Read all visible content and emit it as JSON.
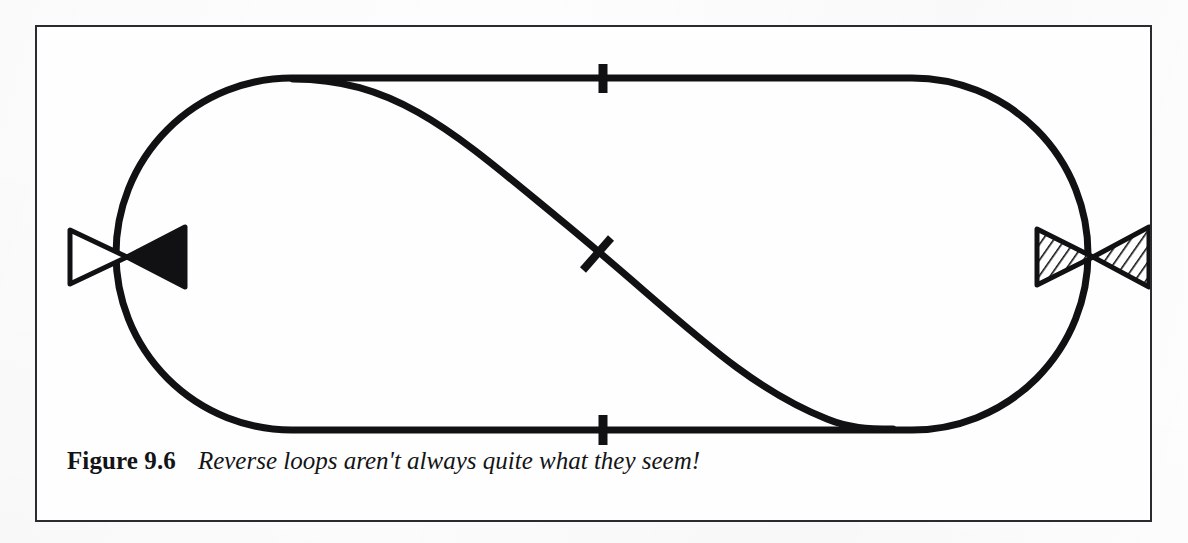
{
  "page": {
    "background_color": "#fdfdfd",
    "figure_border_color": "#2b2b2f"
  },
  "figure": {
    "label": "Figure 9.6",
    "caption": "Reverse loops aren't always quite what they seem!",
    "border_label": "figure-frame"
  },
  "diagram": {
    "ink_color": "#111113",
    "track_stroke_width": 7,
    "elements": [
      {
        "name": "outer-loop",
        "kind": "stadium-oval",
        "description": "Continuous oval running line with straight top and bottom and semicircular ends"
      },
      {
        "name": "diagonal-crossover",
        "kind": "curved-diagonal",
        "description": "Diagonal reverse-loop connector from top-left turnout sweeping to bottom-right tangent"
      },
      {
        "name": "top-insulated-gap",
        "kind": "tick",
        "description": "Insulated rail joiner marked across the top straight"
      },
      {
        "name": "bottom-insulated-gap",
        "kind": "tick",
        "description": "Insulated rail joiner marked across the bottom straight"
      },
      {
        "name": "diagonal-insulated-gap",
        "kind": "tick",
        "description": "Insulated rail joiner marked across the diagonal connector"
      },
      {
        "name": "left-bowtie-marker",
        "kind": "bowtie",
        "fill_left": "white",
        "fill_right": "solid-black"
      },
      {
        "name": "right-bowtie-marker",
        "kind": "bowtie",
        "fill_left": "hatched",
        "fill_right": "hatched"
      }
    ],
    "markers": {
      "left": {
        "label": "left-bowtie",
        "left_triangle_style": "outline",
        "right_triangle_style": "filled"
      },
      "right": {
        "label": "right-bowtie",
        "left_triangle_style": "hatched",
        "right_triangle_style": "hatched"
      }
    },
    "geometry": {
      "oval_left_x": 120,
      "oval_right_x": 1075,
      "oval_top_y": 76,
      "oval_bottom_y": 428,
      "top_straight_start_x": 290,
      "top_straight_end_x": 910,
      "bottom_straight_start_x": 290,
      "bottom_straight_end_x": 910,
      "diagonal_start": [
        290,
        77
      ],
      "diagonal_end": [
        858,
        427
      ],
      "tick_top": [
        600,
        76
      ],
      "tick_bottom": [
        600,
        428
      ],
      "tick_diagonal": [
        594,
        253
      ],
      "left_marker_center": [
        125,
        255
      ],
      "right_marker_center": [
        1072,
        255
      ]
    }
  }
}
